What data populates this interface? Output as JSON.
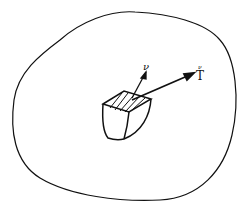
{
  "diagram": {
    "body_outline": "closed-curve-body",
    "element": "volume-element-with-shaded-face",
    "normal_vector": {
      "label": "ν"
    },
    "traction_vector": {
      "label": "T",
      "superscript": "ν"
    },
    "colors": {
      "stroke": "#111111",
      "background": "#ffffff"
    }
  }
}
